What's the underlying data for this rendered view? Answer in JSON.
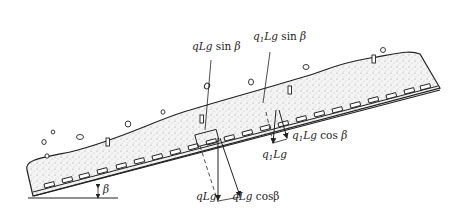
{
  "diagram": {
    "title": "",
    "labels": {
      "qLg_sin": "qLg sin β",
      "q1Lg_sin": "q₁Lg sin β",
      "qLg": "qLg",
      "qLg_cos": "qLg cosβ",
      "q1Lg": "q₁Lg",
      "q1Lg_cos": "q₁Lg cos β",
      "beta": "β"
    },
    "colors": {
      "line": "#222222",
      "fill_material": "#e9e9e9",
      "background": "#ffffff"
    }
  }
}
